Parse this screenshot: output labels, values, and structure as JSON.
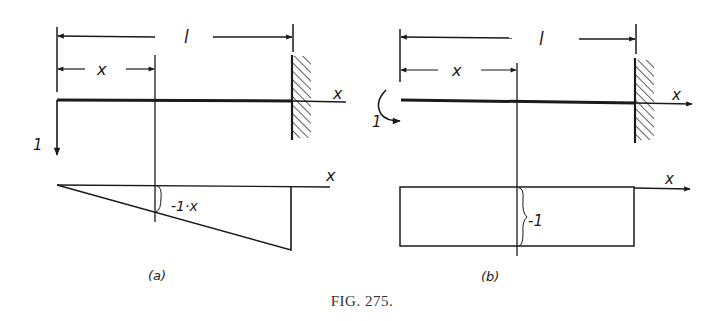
{
  "figure": {
    "caption": "Fig. 275.",
    "caption_display": "FIG. 275."
  },
  "panel_a": {
    "label": "(a)",
    "span_label": "l",
    "section_label": "x",
    "axis_label_beam": "x",
    "axis_label_diagram": "x",
    "load_label": "1",
    "load_type": "point-force-down",
    "support": "fixed-wall-right",
    "diagram_shape": "triangle",
    "diagram_value_label": "-1·x"
  },
  "panel_b": {
    "label": "(b)",
    "span_label": "l",
    "section_label": "x",
    "axis_label_beam": "x",
    "axis_label_diagram": "x",
    "load_label": "1",
    "load_type": "moment-couple",
    "support": "fixed-wall-right",
    "diagram_shape": "rectangle",
    "diagram_value_label": "-1"
  },
  "colors": {
    "ink": "#1a1a1a",
    "background": "#ffffff"
  }
}
